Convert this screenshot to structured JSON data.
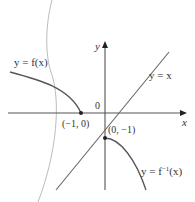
{
  "diagram": {
    "type": "function-inverse-graph",
    "axes": {
      "x_label": "x",
      "y_label": "y",
      "origin_label": "0"
    },
    "curves": [
      {
        "name": "f",
        "label": "y = f(x)"
      },
      {
        "name": "identity",
        "label": "y = x"
      },
      {
        "name": "f_inverse",
        "label": "y = f⁻¹(x)"
      }
    ],
    "points": [
      {
        "label": "(−1, 0)",
        "x": -1,
        "y": 0
      },
      {
        "label": "(0, −1)",
        "x": 0,
        "y": -1
      }
    ],
    "colors": {
      "axes": "#555555",
      "curve": "#555555",
      "mirror": "#999999",
      "text": "#333333"
    }
  },
  "labels": {
    "f": "y = f(x)",
    "identity": "y = x",
    "finv_prefix": "y = f",
    "finv_sup": "−1",
    "finv_suffix": "(x)",
    "point_a": "(−1, 0)",
    "point_b": "(0, −1)",
    "x_axis": "x",
    "y_axis": "y",
    "origin": "0"
  }
}
